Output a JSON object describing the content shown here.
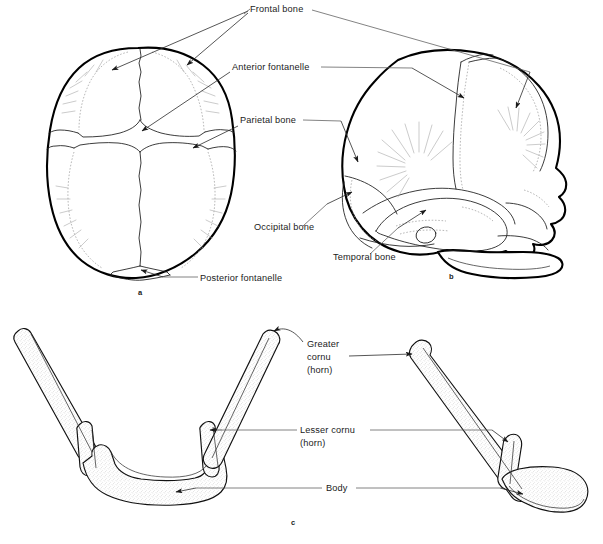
{
  "figure": {
    "background_color": "#ffffff",
    "ink_color": "#000000",
    "leader_color": "#5a5a5a",
    "stipple_color": "#b9b9b9"
  },
  "panels": [
    {
      "id": "a",
      "letter": "a",
      "caption": "a",
      "view": "superior view of fetal skull",
      "letter_x": 138,
      "letter_y": 295
    },
    {
      "id": "b",
      "letter": "b",
      "caption": "b",
      "view": "lateral view of fetal skull",
      "letter_x": 449,
      "letter_y": 279
    },
    {
      "id": "c",
      "letter": "c",
      "caption": "c",
      "view": "hyoid bone, anterior and lateral views",
      "letter_x": 291,
      "letter_y": 525
    }
  ],
  "labels": [
    {
      "id": "frontal-bone",
      "text": "Frontal bone",
      "x": 250,
      "y": 12,
      "anchor": "start"
    },
    {
      "id": "anterior-fontanelle",
      "text": "Anterior fontanelle",
      "x": 232,
      "y": 70,
      "anchor": "start"
    },
    {
      "id": "parietal-bone",
      "text": "Parietal bone",
      "x": 240,
      "y": 123,
      "anchor": "start"
    },
    {
      "id": "occipital-bone",
      "text": "Occipital bone",
      "x": 254,
      "y": 230,
      "anchor": "start"
    },
    {
      "id": "temporal-bone",
      "text": "Temporal bone",
      "x": 333,
      "y": 260,
      "anchor": "start"
    },
    {
      "id": "posterior-fontanelle",
      "text": "Posterior fontanelle",
      "x": 200,
      "y": 281,
      "anchor": "start"
    },
    {
      "id": "greater-cornu-line1",
      "text": "Greater",
      "x": 307,
      "y": 347,
      "anchor": "start"
    },
    {
      "id": "greater-cornu-line2",
      "text": "cornu",
      "x": 307,
      "y": 360,
      "anchor": "start"
    },
    {
      "id": "greater-cornu-line3",
      "text": "(horn)",
      "x": 307,
      "y": 373,
      "anchor": "start"
    },
    {
      "id": "lesser-cornu-line1",
      "text": "Lesser cornu",
      "x": 300,
      "y": 433,
      "anchor": "start"
    },
    {
      "id": "lesser-cornu-line2",
      "text": "(horn)",
      "x": 300,
      "y": 446,
      "anchor": "start"
    },
    {
      "id": "body",
      "text": "Body",
      "x": 326,
      "y": 491,
      "anchor": "start"
    }
  ]
}
